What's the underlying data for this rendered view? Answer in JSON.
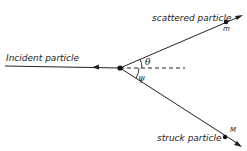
{
  "diagram": {
    "type": "particle-scattering",
    "labels": {
      "incident": "Incident particle",
      "scattered": "scattered particle",
      "struck": "struck particle",
      "scattered_mass": "m",
      "struck_mass": "M",
      "theta": "θ",
      "psi": "ψ"
    },
    "colors": {
      "line": "#222222",
      "background": "#ffffff"
    }
  }
}
